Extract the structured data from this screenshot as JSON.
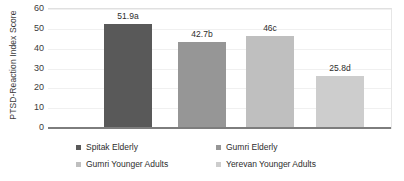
{
  "chart_data": {
    "type": "bar",
    "title": "",
    "xlabel": "",
    "ylabel": "PTSD-Reaction Index Score",
    "ylim": [
      0,
      60
    ],
    "yticks": [
      0,
      10,
      20,
      30,
      40,
      50,
      60
    ],
    "grid": true,
    "legend_position": "bottom",
    "categories": [
      "Spitak Elderly",
      "Gumri Elderly",
      "Gumri Younger Adults",
      "Yerevan Younger Adults"
    ],
    "values": [
      51.9,
      42.7,
      46,
      25.8
    ],
    "data_labels": [
      "51.9a",
      "42.7b",
      "46c",
      "25.8d"
    ],
    "colors": [
      "#595959",
      "#969696",
      "#bfbfbf",
      "#cdcdcd"
    ]
  },
  "axis": {
    "y_title": "PTSD-Reaction Index Score",
    "ticks": [
      {
        "label": "60",
        "value": 60
      },
      {
        "label": "50",
        "value": 50
      },
      {
        "label": "40",
        "value": 40
      },
      {
        "label": "30",
        "value": 30
      },
      {
        "label": "20",
        "value": 20
      },
      {
        "label": "10",
        "value": 10
      },
      {
        "label": "0",
        "value": 0
      }
    ]
  },
  "legend": {
    "items": [
      {
        "label": "Spitak Elderly",
        "color": "#595959"
      },
      {
        "label": "Gumri Elderly",
        "color": "#969696"
      },
      {
        "label": "Gumri Younger Adults",
        "color": "#bfbfbf"
      },
      {
        "label": "Yerevan Younger Adults",
        "color": "#cdcdcd"
      }
    ]
  }
}
